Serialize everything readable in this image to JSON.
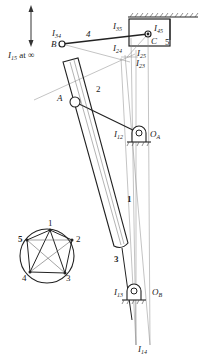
{
  "diagram": {
    "type": "mechanism-instant-centers",
    "labels": {
      "I15": "I",
      "I15_sub": "15",
      "I15_suffix": " at ∞",
      "I34": "I",
      "I34_sub": "34",
      "B": "B",
      "A": "A",
      "link4": "4",
      "link2": "2",
      "link1": "1",
      "link3": "3",
      "link5": "5",
      "I35": "I",
      "I35_sub": "35",
      "I45": "I",
      "I45_sub": "45",
      "C": "C",
      "I24": "I",
      "I24_sub": "24",
      "I25": "I",
      "I25_sub": "25",
      "I23": "I",
      "I23_sub": "23",
      "I12": "I",
      "I12_sub": "12",
      "OA": "O",
      "OA_sub": "A",
      "I13": "I",
      "I13_sub": "13",
      "OB": "O",
      "OB_sub": "B",
      "I14": "I",
      "I14_sub": "14"
    },
    "circle_diagram": {
      "nodes": [
        "1",
        "2",
        "3",
        "4",
        "5"
      ]
    }
  }
}
